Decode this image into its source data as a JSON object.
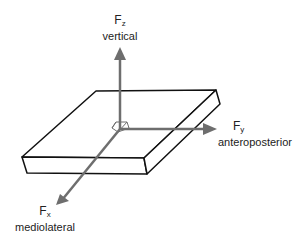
{
  "diagram": {
    "type": "force-plate-axes",
    "colors": {
      "plate_outline": "#111111",
      "axis": "#6e6e6e",
      "text": "#222222"
    },
    "axes": [
      {
        "id": "z",
        "symbol": "F",
        "subscript": "z",
        "name": "vertical"
      },
      {
        "id": "y",
        "symbol": "F",
        "subscript": "y",
        "name": "anteroposterior"
      },
      {
        "id": "x",
        "symbol": "F",
        "subscript": "x",
        "name": "mediolateral"
      }
    ]
  }
}
